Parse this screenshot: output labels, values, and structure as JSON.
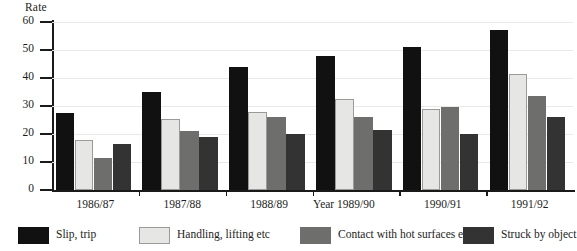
{
  "chart_data": {
    "type": "bar",
    "title": "",
    "ylabel": "Rate",
    "xlabel": "Year",
    "ylim": [
      0,
      60
    ],
    "yticks": [
      0,
      10,
      20,
      30,
      40,
      50,
      60
    ],
    "ytick_labels": [
      "0",
      "10",
      "20",
      "30",
      "40",
      "50",
      "60"
    ],
    "grid": true,
    "legend_position": "bottom",
    "categories": [
      "1986/87",
      "1987/88",
      "1988/89",
      "1989/90",
      "1990/91",
      "1991/92"
    ],
    "series": [
      {
        "name": "Slip, trip",
        "color": "#111111",
        "values": [
          27.5,
          35,
          44,
          48,
          51,
          57
        ]
      },
      {
        "name": "Handling, lifting etc",
        "color": "#e6e6e4",
        "values": [
          18,
          25.5,
          28,
          32.5,
          29,
          41.5
        ]
      },
      {
        "name": "Contact with hot surfaces etc",
        "color": "#6e6e6c",
        "values": [
          11.5,
          21,
          26,
          26,
          29.5,
          33.5
        ]
      },
      {
        "name": "Struck by object",
        "color": "#333333",
        "values": [
          16.5,
          19,
          20,
          21.5,
          20,
          26
        ]
      }
    ]
  }
}
